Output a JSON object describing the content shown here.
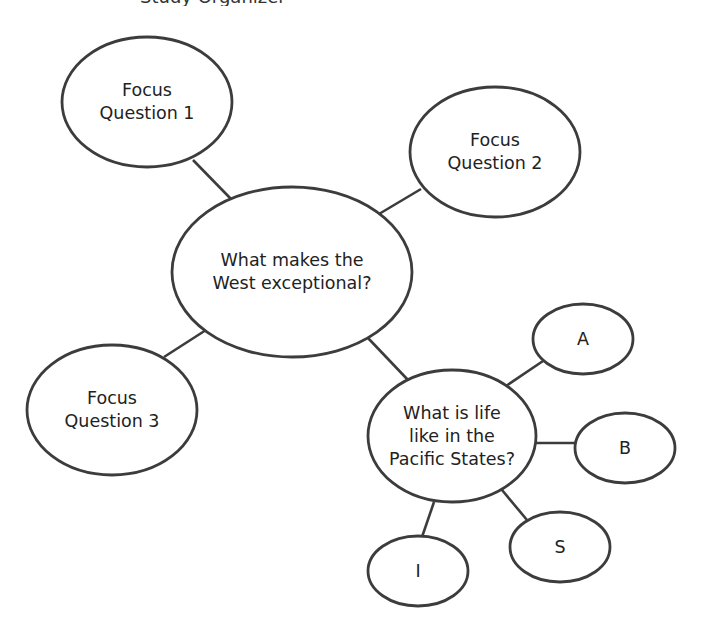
{
  "diagram": {
    "type": "concept-web",
    "top_clipped_text": "Study Organizer",
    "stroke_color": "#3c3c3c",
    "text_color": "#222222",
    "background": "#ffffff",
    "central": {
      "id": "center",
      "label": "What makes the\nWest exceptional?",
      "cx": 292,
      "cy": 272,
      "rx": 120,
      "ry": 85
    },
    "nodes": [
      {
        "id": "fq1",
        "label": "Focus\nQuestion 1",
        "cx": 147,
        "cy": 102,
        "rx": 85,
        "ry": 65
      },
      {
        "id": "fq2",
        "label": "Focus\nQuestion 2",
        "cx": 495,
        "cy": 152,
        "rx": 85,
        "ry": 65
      },
      {
        "id": "fq3",
        "label": "Focus\nQuestion 3",
        "cx": 112,
        "cy": 410,
        "rx": 85,
        "ry": 65
      },
      {
        "id": "pacific",
        "label": "What is life\nlike in the\nPacific States?",
        "cx": 452,
        "cy": 436,
        "rx": 84,
        "ry": 66
      },
      {
        "id": "a",
        "label": "A",
        "cx": 583,
        "cy": 339,
        "rx": 50,
        "ry": 35
      },
      {
        "id": "b",
        "label": "B",
        "cx": 625,
        "cy": 448,
        "rx": 50,
        "ry": 35
      },
      {
        "id": "s",
        "label": "S",
        "cx": 560,
        "cy": 547,
        "rx": 50,
        "ry": 35
      },
      {
        "id": "i",
        "label": "I",
        "cx": 418,
        "cy": 571,
        "rx": 50,
        "ry": 35
      }
    ],
    "edges": [
      {
        "from": "fq1",
        "to": "center",
        "x1": 193,
        "y1": 160,
        "x2": 231,
        "y2": 199
      },
      {
        "from": "fq2",
        "to": "center",
        "x1": 421,
        "y1": 189,
        "x2": 379,
        "y2": 214
      },
      {
        "from": "fq3",
        "to": "center",
        "x1": 164,
        "y1": 357,
        "x2": 206,
        "y2": 330
      },
      {
        "from": "center",
        "to": "pacific",
        "x1": 368,
        "y1": 338,
        "x2": 408,
        "y2": 380
      },
      {
        "from": "pacific",
        "to": "a",
        "x1": 506,
        "y1": 386,
        "x2": 543,
        "y2": 361
      },
      {
        "from": "pacific",
        "to": "b",
        "x1": 536,
        "y1": 443,
        "x2": 575,
        "y2": 443
      },
      {
        "from": "pacific",
        "to": "s",
        "x1": 502,
        "y1": 490,
        "x2": 527,
        "y2": 520
      },
      {
        "from": "pacific",
        "to": "i",
        "x1": 434,
        "y1": 502,
        "x2": 422,
        "y2": 537
      }
    ]
  }
}
